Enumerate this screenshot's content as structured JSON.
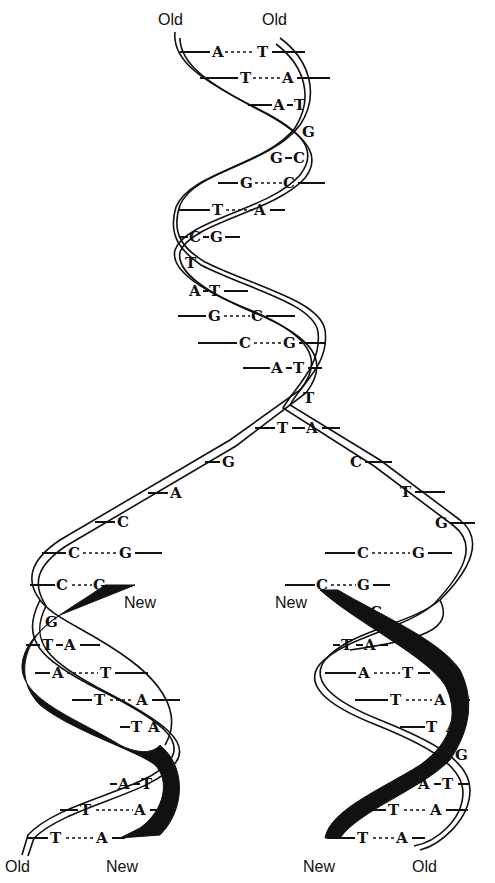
{
  "diagram": {
    "labels": {
      "top_left": "Old",
      "top_right": "Old",
      "fork_left_new": "New",
      "fork_right_new": "New",
      "bottom_left_old": "Old",
      "bottom_left_new": "New",
      "bottom_right_new": "New",
      "bottom_right_old": "Old"
    },
    "parent_helix_pairs": [
      {
        "left": "A",
        "right": "T",
        "bond": "---"
      },
      {
        "left": "T",
        "right": "A",
        "bond": "---"
      },
      {
        "left": "A",
        "right": "T",
        "bond": "-"
      },
      {
        "single": "G"
      },
      {
        "left": "G",
        "right": "C",
        "bond": "-"
      },
      {
        "left": "G",
        "right": "C",
        "bond": "---"
      },
      {
        "left": "T",
        "right": "A",
        "bond": "---"
      },
      {
        "left": "C",
        "right": "G",
        "bond": "-"
      },
      {
        "single": "T"
      },
      {
        "left": "A",
        "right": "T",
        "bond": "-"
      },
      {
        "left": "G",
        "right": "C",
        "bond": "---"
      },
      {
        "left": "C",
        "right": "G",
        "bond": "---"
      },
      {
        "left": "A",
        "right": "T",
        "bond": "-"
      },
      {
        "single": "T"
      },
      {
        "left": "T",
        "right": "A",
        "bond": "-"
      }
    ],
    "left_unpaired": [
      "G",
      "A",
      "C"
    ],
    "right_unpaired": [
      "C",
      "T",
      "G"
    ],
    "left_daughter_pairs": [
      {
        "left": "C",
        "right": "G",
        "bond": "---"
      },
      {
        "left": "C",
        "right": "G",
        "bond": "--"
      },
      {
        "single": "G"
      },
      {
        "left": "T",
        "right": "A",
        "bond": "-"
      },
      {
        "left": "A",
        "right": "T",
        "bond": "---"
      },
      {
        "left": "T",
        "right": "A",
        "bond": "---"
      },
      {
        "left": "T",
        "right": "A",
        "bond": "-"
      },
      {
        "single": "C"
      },
      {
        "left": "A",
        "right": "T",
        "bond": "-"
      },
      {
        "left": "T",
        "right": "A",
        "bond": "---"
      },
      {
        "left": "T",
        "right": "A",
        "bond": "---"
      }
    ],
    "right_daughter_pairs": [
      {
        "left": "C",
        "right": "G",
        "bond": "---"
      },
      {
        "left": "C",
        "right": "G",
        "bond": "--"
      },
      {
        "single": "C"
      },
      {
        "left": "T",
        "right": "A",
        "bond": "-"
      },
      {
        "left": "A",
        "right": "T",
        "bond": "---"
      },
      {
        "left": "T",
        "right": "A",
        "bond": "---"
      },
      {
        "left": "T",
        "right": "A",
        "bond": "-"
      },
      {
        "single": "G"
      },
      {
        "left": "A",
        "right": "T",
        "bond": "-"
      },
      {
        "left": "T",
        "right": "A",
        "bond": "---"
      },
      {
        "left": "T",
        "right": "A",
        "bond": "---"
      }
    ],
    "colors": {
      "ink": "#111111",
      "background": "#ffffff",
      "new_strand": "#111111"
    }
  }
}
